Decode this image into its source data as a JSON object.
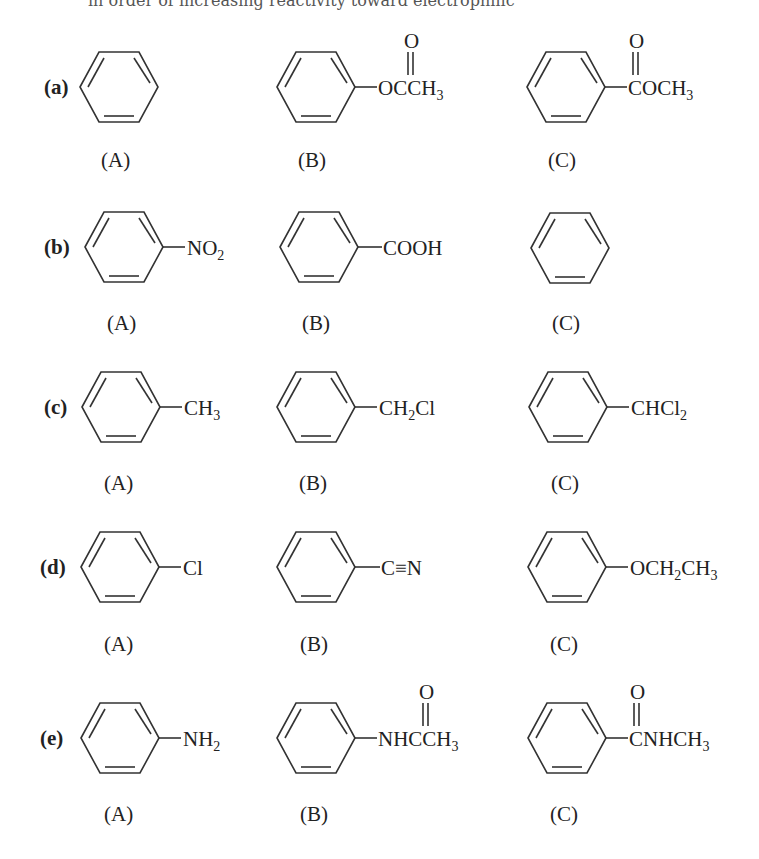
{
  "page": {
    "clipped_top_text": "in order of increasing reactivity toward electrophilic"
  },
  "rows": [
    {
      "label": "(a)",
      "compounds": [
        {
          "caption": "(A)",
          "name": "benzene",
          "substituent": ""
        },
        {
          "caption": "(B)",
          "name": "phenyl acetate",
          "substituent": "OCCH3",
          "carbonyl_oxygen": "O"
        },
        {
          "caption": "(C)",
          "name": "methyl benzoate",
          "substituent": "COCH3",
          "carbonyl_oxygen": "O"
        }
      ]
    },
    {
      "label": "(b)",
      "compounds": [
        {
          "caption": "(A)",
          "name": "nitrobenzene",
          "substituent": "NO2"
        },
        {
          "caption": "(B)",
          "name": "benzoic acid",
          "substituent": "COOH"
        },
        {
          "caption": "(C)",
          "name": "benzene",
          "substituent": ""
        }
      ]
    },
    {
      "label": "(c)",
      "compounds": [
        {
          "caption": "(A)",
          "name": "toluene",
          "substituent": "CH3"
        },
        {
          "caption": "(B)",
          "name": "benzyl chloride",
          "substituent": "CH2Cl"
        },
        {
          "caption": "(C)",
          "name": "benzal chloride",
          "substituent": "CHCl2"
        }
      ]
    },
    {
      "label": "(d)",
      "compounds": [
        {
          "caption": "(A)",
          "name": "chlorobenzene",
          "substituent": "Cl"
        },
        {
          "caption": "(B)",
          "name": "benzonitrile",
          "substituent": "C≡N"
        },
        {
          "caption": "(C)",
          "name": "ethoxybenzene",
          "substituent": "OCH2CH3"
        }
      ]
    },
    {
      "label": "(e)",
      "compounds": [
        {
          "caption": "(A)",
          "name": "aniline",
          "substituent": "NH2"
        },
        {
          "caption": "(B)",
          "name": "acetanilide",
          "substituent": "NHCCH3",
          "carbonyl_oxygen": "O"
        },
        {
          "caption": "(C)",
          "name": "N-methylbenzamide",
          "substituent": "CNHCH3",
          "carbonyl_oxygen": "O"
        }
      ]
    }
  ]
}
